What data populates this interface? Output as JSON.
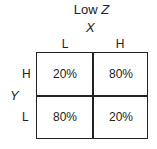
{
  "title": {
    "prefix": "Low ",
    "variable": "Z"
  },
  "x_axis": {
    "label": "X",
    "levels": [
      "L",
      "H"
    ]
  },
  "y_axis": {
    "label": "Y",
    "levels": [
      "H",
      "L"
    ]
  },
  "cells": [
    [
      "20%",
      "80%"
    ],
    [
      "80%",
      "20%"
    ]
  ]
}
